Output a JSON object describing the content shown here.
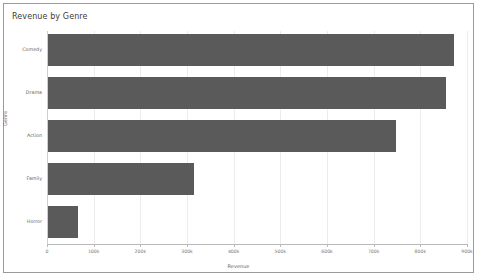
{
  "panel": {
    "title": "Revenue by Genre",
    "border_color": "#9a9a9a",
    "background": "#ffffff"
  },
  "chart_data": {
    "type": "bar",
    "orientation": "horizontal",
    "title": "Revenue by Genre",
    "xlabel": "Revenue",
    "ylabel": "Genre",
    "categories": [
      "Comedy",
      "Drama",
      "Action",
      "Family",
      "Horror"
    ],
    "values": [
      872000,
      855000,
      748000,
      315000,
      67000
    ],
    "xlim": [
      0,
      900000
    ],
    "xticks": [
      0,
      100000,
      200000,
      300000,
      400000,
      500000,
      600000,
      700000,
      800000,
      900000
    ],
    "xticklabels": [
      "0",
      "100k",
      "200k",
      "300k",
      "400k",
      "500k",
      "600k",
      "700k",
      "800k",
      "900k"
    ],
    "grid": true,
    "legend": "none",
    "bar_color": "#5a5a5a",
    "grid_color": "#ececec"
  }
}
